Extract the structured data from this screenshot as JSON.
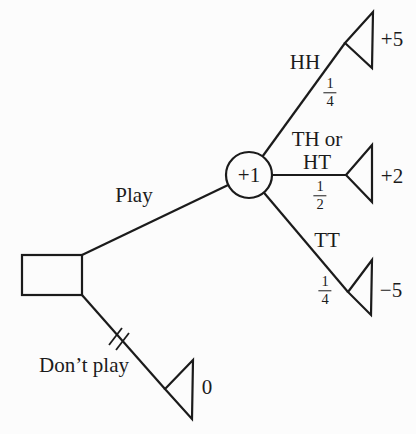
{
  "tree": {
    "decision_node": {
      "shape": "square"
    },
    "chance_node": {
      "shape": "circle",
      "value": "+1"
    },
    "branches": {
      "play": {
        "label": "Play"
      },
      "dont_play": {
        "label": "Don’t play",
        "payoff": "0",
        "pruned": true
      },
      "hh": {
        "label": "HH",
        "probability": "1/4",
        "prob_num": "1",
        "prob_den": "4",
        "payoff": "+5"
      },
      "th_or_ht": {
        "label_line1": "TH or",
        "label_line2": "HT",
        "probability": "1/2",
        "prob_num": "1",
        "prob_den": "2",
        "payoff": "+2"
      },
      "tt": {
        "label": "TT",
        "probability": "1/4",
        "prob_num": "1",
        "prob_den": "4",
        "payoff": "−5"
      }
    },
    "colors": {
      "line": "#1b1b1b",
      "text": "#1b1b1b",
      "background": "#fcfcfc"
    }
  }
}
